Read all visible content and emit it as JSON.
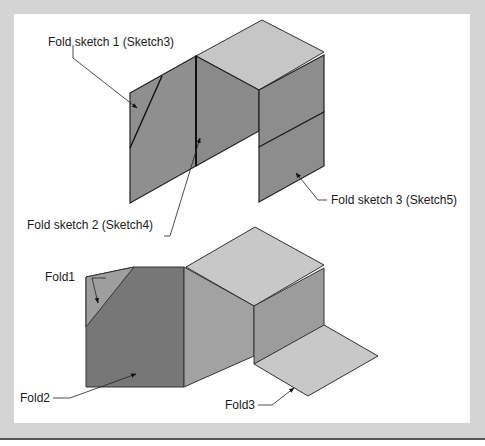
{
  "figure": {
    "top_model": {
      "labels": {
        "fold_sketch_1": "Fold sketch 1 (Sketch3)",
        "fold_sketch_2": "Fold sketch 2 (Sketch4)",
        "fold_sketch_3": "Fold sketch 3 (Sketch5)"
      }
    },
    "bottom_model": {
      "labels": {
        "fold1": "Fold1",
        "fold2": "Fold2",
        "fold3": "Fold3"
      }
    }
  },
  "colors": {
    "background": "#d4d4d4",
    "panel": "#ffffff",
    "face_dark": "#7a7a7a",
    "face_mid": "#9a9a9a",
    "face_light": "#c4c4c4",
    "edge": "#222222"
  }
}
